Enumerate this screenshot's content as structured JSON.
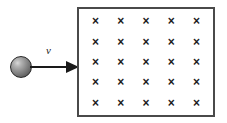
{
  "figure": {
    "background_color": "#ffffff",
    "width": 227,
    "height": 123
  },
  "particle": {
    "name": "sphere",
    "shape": "circle",
    "fill": "gray-radial-gradient",
    "highlight_color": "#d8d8d8",
    "shadow_color": "#3c3c3c",
    "outline_color": "#2a2a2a"
  },
  "velocity": {
    "label": "v",
    "direction": "right",
    "arrow_color": "#1a1a1a"
  },
  "field_region": {
    "border_color": "#4a4a4a",
    "fill_color": "#ffffff",
    "symbol": "×",
    "symbol_color": "#1c1c1c",
    "rows": 5,
    "columns": 5,
    "grid": [
      [
        "×",
        "×",
        "×",
        "×",
        "×"
      ],
      [
        "×",
        "×",
        "×",
        "×",
        "×"
      ],
      [
        "×",
        "×",
        "×",
        "×",
        "×"
      ],
      [
        "×",
        "×",
        "×",
        "×",
        "×"
      ],
      [
        "×",
        "×",
        "×",
        "×",
        "×"
      ]
    ]
  }
}
